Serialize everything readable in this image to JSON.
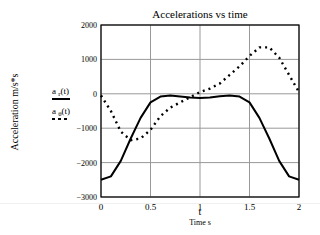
{
  "chart_data": {
    "type": "line",
    "title": "Accelerations vs time",
    "xlabel": "t",
    "xlabel_sub": "Time s",
    "ylabel": "Acceleration m/s*s",
    "xlim": [
      0,
      2
    ],
    "ylim": [
      -3000,
      2000
    ],
    "xticks": [
      0,
      0.5,
      1,
      1.5,
      2
    ],
    "xtick_labels": [
      "0",
      "0.5",
      "1",
      "1.5",
      "2"
    ],
    "yticks": [
      -3000,
      -2000,
      -1000,
      0,
      1000,
      2000
    ],
    "ytick_labels": [
      "−3000",
      "−2000",
      "−1000",
      "0",
      "1000",
      "2000"
    ],
    "grid": true,
    "legend_position": "left",
    "x": [
      0,
      0.1,
      0.2,
      0.3,
      0.4,
      0.5,
      0.6,
      0.7,
      0.8,
      0.9,
      1.0,
      1.1,
      1.2,
      1.3,
      1.4,
      1.5,
      1.6,
      1.7,
      1.8,
      1.9,
      2.0
    ],
    "series": [
      {
        "name": "a_r(t)",
        "label_main": "a",
        "label_sub": "r",
        "label_arg": "(t)",
        "style": "solid",
        "color": "#000000",
        "values": [
          -2500,
          -2400,
          -1950,
          -1300,
          -700,
          -250,
          -80,
          -50,
          -80,
          -110,
          -120,
          -110,
          -70,
          -50,
          -80,
          -250,
          -700,
          -1300,
          -1950,
          -2400,
          -2500
        ]
      },
      {
        "name": "a_θ(t)",
        "label_main": "a",
        "label_sub": "θ",
        "label_arg": "(t)",
        "style": "dotted",
        "color": "#000000",
        "values": [
          -50,
          -500,
          -1100,
          -1350,
          -1300,
          -1050,
          -650,
          -400,
          -250,
          -100,
          50,
          150,
          300,
          550,
          800,
          1100,
          1350,
          1350,
          1050,
          550,
          50
        ]
      }
    ]
  }
}
